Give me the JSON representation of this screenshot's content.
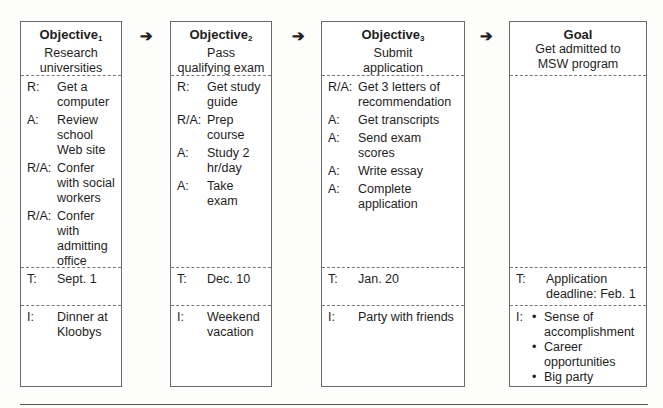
{
  "columns": [
    {
      "title": "Objective",
      "subscript": "1",
      "subtitle": [
        "Research",
        "universities"
      ],
      "actions": [
        {
          "code": "R:",
          "text": "Get a computer"
        },
        {
          "code": "A:",
          "text": "Review school Web site"
        },
        {
          "code": "R/A:",
          "text": "Confer with social workers"
        },
        {
          "code": "R/A:",
          "text": "Confer with admitting office"
        }
      ],
      "time": {
        "code": "T:",
        "text": "Sept. 1"
      },
      "incentive": {
        "code": "I:",
        "text": "Dinner at Kloobys"
      }
    },
    {
      "title": "Objective",
      "subscript": "2",
      "subtitle": [
        "Pass",
        "qualifying exam"
      ],
      "actions": [
        {
          "code": "R:",
          "text": "Get study guide"
        },
        {
          "code": "R/A:",
          "text": "Prep course"
        },
        {
          "code": "A:",
          "text": "Study 2 hr/day"
        },
        {
          "code": "A:",
          "text": "Take exam"
        }
      ],
      "time": {
        "code": "T:",
        "text": "Dec. 10"
      },
      "incentive": {
        "code": "I:",
        "text": "Weekend vacation"
      }
    },
    {
      "title": "Objective",
      "subscript": "3",
      "subtitle": [
        "Submit",
        "application"
      ],
      "actions": [
        {
          "code": "R/A:",
          "text": "Get 3 letters of recommendation"
        },
        {
          "code": "A:",
          "text": "Get transcripts"
        },
        {
          "code": "A:",
          "text": "Send exam scores"
        },
        {
          "code": "A:",
          "text": "Write essay"
        },
        {
          "code": "A:",
          "text": "Complete application"
        }
      ],
      "time": {
        "code": "T:",
        "text": "Jan. 20"
      },
      "incentive": {
        "code": "I:",
        "text": "Party with friends"
      }
    },
    {
      "title": "Goal",
      "subscript": "",
      "subtitle": [
        "Get admitted to",
        "MSW program"
      ],
      "actions": [],
      "time": {
        "code": "T:",
        "text": "Application deadline: Feb. 1"
      },
      "incentive": {
        "code": "I:",
        "bullets": [
          "Sense of accomplishment",
          "Career opportunities",
          "Big party"
        ]
      }
    }
  ],
  "arrows": [
    "arrow-right",
    "arrow-right",
    "arrow-right"
  ]
}
